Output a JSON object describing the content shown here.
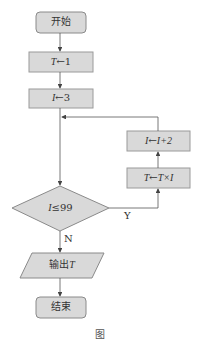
{
  "diagram": {
    "type": "flowchart",
    "colors": {
      "fill": "#d9d9d9",
      "stroke": "#8a8a8a",
      "line": "#555555",
      "text": "#333333"
    },
    "nodes": {
      "start": {
        "shape": "rounded-rect",
        "label": "开始"
      },
      "init_t": {
        "shape": "rect",
        "var": "T",
        "arrow": "←",
        "value": "1"
      },
      "init_i": {
        "shape": "rect",
        "var": "I",
        "arrow": "←",
        "value": "3"
      },
      "decision": {
        "shape": "diamond",
        "var": "I",
        "op": "≤",
        "value": "99"
      },
      "update_t": {
        "shape": "rect",
        "var": "T",
        "arrow": "←",
        "expr": "T×I"
      },
      "update_i": {
        "shape": "rect",
        "var": "I",
        "arrow": "←",
        "expr": "I+2"
      },
      "output": {
        "shape": "parallelogram",
        "prefix": "输出",
        "var": "T"
      },
      "end": {
        "shape": "rounded-rect",
        "label": "结束"
      }
    },
    "edges": {
      "yes_label": "Y",
      "no_label": "N"
    },
    "caption": "图"
  }
}
